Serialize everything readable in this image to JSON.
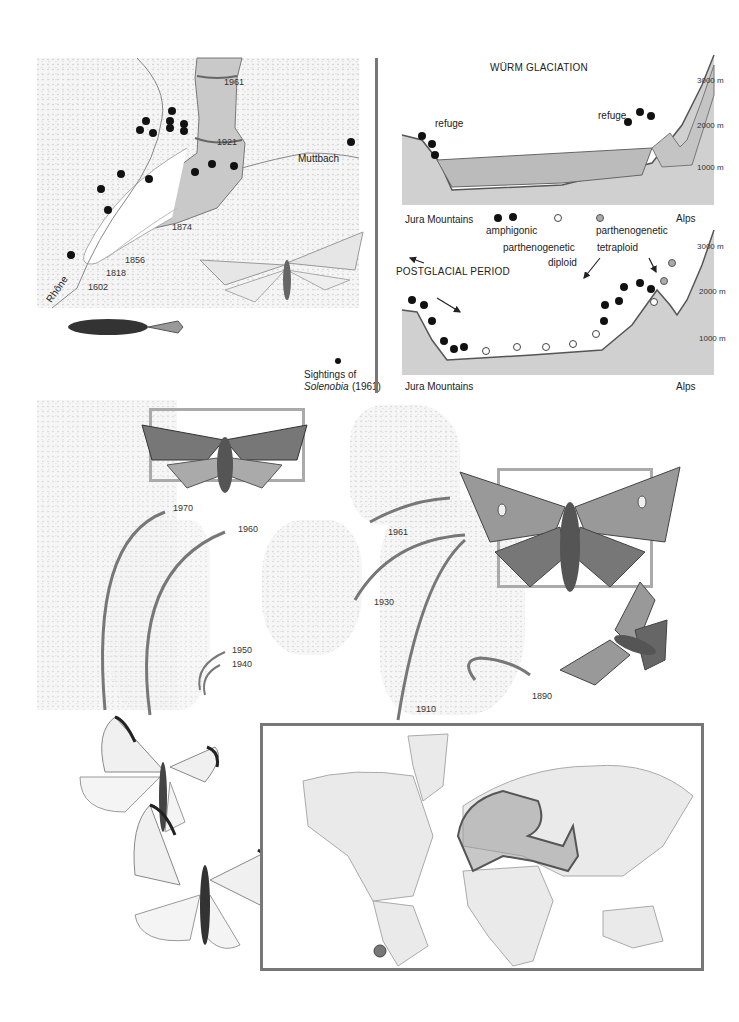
{
  "glacier_panel": {
    "river_label": "Rhône",
    "stream_label": "Muttbach",
    "years": [
      "1961",
      "1921",
      "1874",
      "1856",
      "1818",
      "1602"
    ],
    "legend": {
      "line1": "Sightings of",
      "genus": "Solenobia",
      "year": "(1961)"
    }
  },
  "profiles": {
    "wurm": {
      "title": "WÜRM GLACIATION",
      "refuge_left": "refuge",
      "refuge_right": "refuge",
      "left_region": "Jura Mountains",
      "right_region": "Alps",
      "ticks": [
        "3000 m",
        "2000 m",
        "1000 m"
      ]
    },
    "legend": {
      "amphigonic": "amphigonic",
      "diploid_line1": "parthenogenetic",
      "diploid_line2": "diploid",
      "tetraploid_line1": "parthenogenetic",
      "tetraploid_line2": "tetraploid"
    },
    "postglacial": {
      "title": "POSTGLACIAL PERIOD",
      "left_region": "Jura Mountains",
      "right_region": "Alps",
      "ticks": [
        "3000 m",
        "2000 m",
        "1000 m"
      ]
    }
  },
  "spread_maps": {
    "continent_years": [
      "1970",
      "1960",
      "1950",
      "1940"
    ],
    "britain_years": [
      "1961",
      "1930",
      "1910",
      "1890"
    ]
  },
  "world_map": {
    "highlight_color": "#555555"
  }
}
